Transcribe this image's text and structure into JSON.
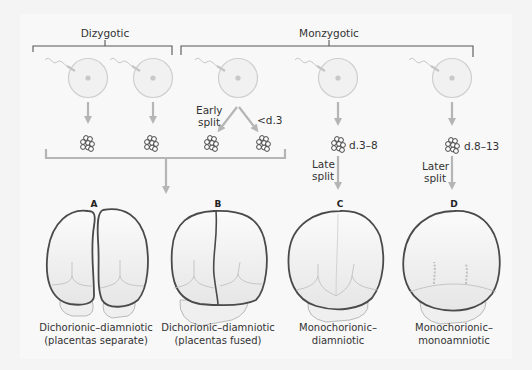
{
  "diagram": {
    "groups": {
      "dizygotic": "Dizygotic",
      "monozygotic": "Monzygotic"
    },
    "split_labels": {
      "early_split_1": "Early",
      "early_split_2": "split",
      "early_day": "<d.3",
      "late_day": "d.3–8",
      "late_split_1": "Late",
      "late_split_2": "split",
      "later_day": "d.8–13",
      "later_split_1": "Later",
      "later_split_2": "split"
    },
    "outcomes": [
      {
        "letter": "A",
        "caption_1": "Dichorionic–diamniotic",
        "caption_2": "(placentas separate)"
      },
      {
        "letter": "B",
        "caption_1": "Dichorionic–diamniotic",
        "caption_2": "(placentas fused)"
      },
      {
        "letter": "C",
        "caption_1": "Monochorionic–",
        "caption_2": "diamniotic"
      },
      {
        "letter": "D",
        "caption_1": "Monochorionic–",
        "caption_2": "monoamniotic"
      }
    ],
    "colors": {
      "background": "#f4f4f4",
      "panel": "#f8f8f8",
      "line_dark": "#555555",
      "arrow_grey": "#b5b5b5",
      "egg_fill": "#f1f1f1",
      "egg_stroke": "#cfcfcf",
      "chorion_stroke": "#4a4a4a",
      "sac_fill": "#ececec"
    }
  }
}
